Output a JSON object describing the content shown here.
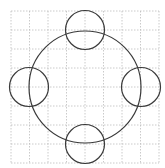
{
  "diagram": {
    "type": "geometric-figure",
    "colors": {
      "background": "#ffffff",
      "grid": "#bdbdbd",
      "stroke": "#3a3a3a"
    },
    "grid": {
      "x0": 11,
      "y0": 11,
      "cols": 8,
      "rows": 8,
      "cell_w": 18.5,
      "cell_h": 19
    },
    "circles": [
      {
        "name": "main-circle",
        "cx": 85,
        "cy": 87,
        "r": 56
      },
      {
        "name": "top-circle",
        "cx": 85,
        "cy": 30,
        "r": 19.5
      },
      {
        "name": "bottom-circle",
        "cx": 85,
        "cy": 144,
        "r": 19.5
      },
      {
        "name": "left-circle",
        "cx": 29,
        "cy": 87,
        "r": 19.5
      },
      {
        "name": "right-circle",
        "cx": 141,
        "cy": 87,
        "r": 19.5
      }
    ]
  }
}
